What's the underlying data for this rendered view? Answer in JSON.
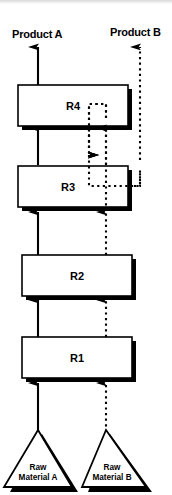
{
  "diagram": {
    "colors": {
      "line": "#000000",
      "fill": "#ffffff",
      "shadow": "#000000",
      "background": "#ffffff"
    },
    "outputs": [
      {
        "id": "product-a",
        "label": "Product A",
        "stream": "solid"
      },
      {
        "id": "product-b",
        "label": "Product B",
        "stream": "dashed"
      }
    ],
    "units": [
      {
        "id": "r4",
        "label": "R4"
      },
      {
        "id": "r3",
        "label": "R3"
      },
      {
        "id": "r2",
        "label": "R2"
      },
      {
        "id": "r1",
        "label": "R1"
      }
    ],
    "feeds": [
      {
        "id": "raw-material-a",
        "line1": "Raw",
        "line2": "Material A",
        "stream": "solid"
      },
      {
        "id": "raw-material-b",
        "line1": "Raw",
        "line2": "Material B",
        "stream": "dashed"
      }
    ],
    "streams": [
      {
        "id": "a-r1-r2",
        "style": "solid",
        "from": "R1",
        "to": "R2"
      },
      {
        "id": "a-r2-r3",
        "style": "solid",
        "from": "R2",
        "to": "R3"
      },
      {
        "id": "a-r3-r4",
        "style": "solid",
        "from": "R3",
        "to": "R4"
      },
      {
        "id": "a-r4-product-a",
        "style": "solid",
        "from": "R4",
        "to": "Product A"
      },
      {
        "id": "b-r1-r2",
        "style": "dashed",
        "from": "R1",
        "to": "R2"
      },
      {
        "id": "b-r2-r3",
        "style": "dashed",
        "from": "R2",
        "to": "R3"
      },
      {
        "id": "b-r3-r4",
        "style": "dashed",
        "from": "R3",
        "to": "R4"
      },
      {
        "id": "b-recycle-r4-r3",
        "style": "dashed",
        "from": "R4",
        "to": "R3"
      },
      {
        "id": "b-r3-product-b",
        "style": "dashed",
        "from": "R3",
        "to": "Product B"
      },
      {
        "id": "feed-a-r1",
        "style": "solid",
        "from": "Raw Material A",
        "to": "R1"
      },
      {
        "id": "feed-b-r1",
        "style": "dashed",
        "from": "Raw Material B",
        "to": "R1"
      }
    ]
  }
}
